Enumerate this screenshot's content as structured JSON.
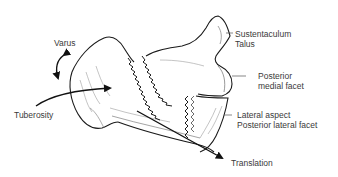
{
  "diagram": {
    "type": "anatomical-illustration",
    "colors": {
      "line": "#1a1a1a",
      "text": "#3a3a3a",
      "background": "#ffffff",
      "shading": "#9a9a9a"
    },
    "labels": {
      "varus": "Varus",
      "tuberosity": "Tuberosity",
      "sustentaculum_line1": "Sustentaculum",
      "sustentaculum_line2": "Talus",
      "posterior_medial_line1": "Posterior",
      "posterior_medial_line2": "medial facet",
      "lateral_line1": "Lateral aspect",
      "lateral_line2": "Posterior lateral facet",
      "translation": "Translation"
    },
    "arrows": [
      {
        "name": "varus",
        "kind": "curved double-headed rotation"
      },
      {
        "name": "tuberosity",
        "kind": "curved arrow pointing right into fragment"
      },
      {
        "name": "translation",
        "kind": "straight arrow pointing down-right"
      }
    ]
  }
}
